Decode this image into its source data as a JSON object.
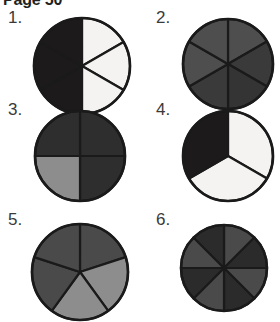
{
  "header": {
    "text": "Page 50"
  },
  "palette": {
    "ink": "#1a1a1a",
    "paper": "#ffffff",
    "black_fill": "#1c1a1a",
    "very_dark_gray": "#2b2b2b",
    "dark_gray": "#3a3a3a",
    "medium_gray": "#4a4a4a",
    "mid_gray": "#565656",
    "light_gray": "#8d8d8d",
    "lighter_gray": "#9a9a9a",
    "white_fill": "#f4f3f1",
    "label_color": "#3a3a3a"
  },
  "chart_data": [
    {
      "type": "pie",
      "id": "pie-1",
      "label": "1.",
      "slice_count": 6,
      "equal_slices": true,
      "slice_fraction": "1/6",
      "shaded_count": 3,
      "unshaded_count": 3,
      "fraction_shaded": "3/6",
      "start_angle_deg": -90,
      "radius": 48,
      "slices": [
        {
          "index": 0,
          "value": 1,
          "state": "unshaded",
          "fill": "#f4f3f1"
        },
        {
          "index": 1,
          "value": 1,
          "state": "unshaded",
          "fill": "#f4f3f1"
        },
        {
          "index": 2,
          "value": 1,
          "state": "unshaded",
          "fill": "#f4f3f1"
        },
        {
          "index": 3,
          "value": 1,
          "state": "shaded",
          "fill": "#1c1a1a"
        },
        {
          "index": 4,
          "value": 1,
          "state": "shaded",
          "fill": "#1c1a1a"
        },
        {
          "index": 5,
          "value": 1,
          "state": "shaded",
          "fill": "#1c1a1a"
        }
      ]
    },
    {
      "type": "pie",
      "id": "pie-2",
      "label": "2.",
      "slice_count": 6,
      "equal_slices": true,
      "slice_fraction": "1/6",
      "shaded_count": 6,
      "unshaded_count": 0,
      "fraction_shaded": "6/6",
      "start_angle_deg": -90,
      "radius": 45,
      "slices": [
        {
          "index": 0,
          "value": 1,
          "state": "shaded",
          "fill": "#4e4e4e"
        },
        {
          "index": 1,
          "value": 1,
          "state": "shaded",
          "fill": "#3a3a3a"
        },
        {
          "index": 2,
          "value": 1,
          "state": "shaded",
          "fill": "#343434"
        },
        {
          "index": 3,
          "value": 1,
          "state": "shaded",
          "fill": "#3a3a3a"
        },
        {
          "index": 4,
          "value": 1,
          "state": "shaded",
          "fill": "#4e4e4e"
        },
        {
          "index": 5,
          "value": 1,
          "state": "shaded",
          "fill": "#4e4e4e"
        }
      ]
    },
    {
      "type": "pie",
      "id": "pie-3",
      "label": "3.",
      "slice_count": 4,
      "equal_slices": true,
      "slice_fraction": "1/4",
      "shaded_count": 3,
      "unshaded_count": 1,
      "fraction_shaded": "3/4",
      "start_angle_deg": -90,
      "radius": 45,
      "slices": [
        {
          "index": 0,
          "value": 1,
          "state": "shaded",
          "fill": "#2e2e2e"
        },
        {
          "index": 1,
          "value": 1,
          "state": "shaded",
          "fill": "#2e2e2e"
        },
        {
          "index": 2,
          "value": 1,
          "state": "light",
          "fill": "#8d8d8d"
        },
        {
          "index": 3,
          "value": 1,
          "state": "shaded",
          "fill": "#2e2e2e"
        }
      ]
    },
    {
      "type": "pie",
      "id": "pie-4",
      "label": "4.",
      "slice_count": 3,
      "equal_slices": true,
      "slice_fraction": "1/3",
      "shaded_count": 1,
      "unshaded_count": 2,
      "fraction_shaded": "1/3",
      "start_angle_deg": -90,
      "radius": 45,
      "slices": [
        {
          "index": 0,
          "value": 1,
          "state": "unshaded",
          "fill": "#f4f3f1"
        },
        {
          "index": 1,
          "value": 1,
          "state": "unshaded",
          "fill": "#f4f3f1"
        },
        {
          "index": 2,
          "value": 1,
          "state": "shaded",
          "fill": "#1c1a1a"
        }
      ]
    },
    {
      "type": "pie",
      "id": "pie-5",
      "label": "5.",
      "slice_count": 5,
      "equal_slices": true,
      "slice_fraction": "1/5",
      "shaded_count": 3,
      "unshaded_count": 2,
      "fraction_shaded": "3/5",
      "start_angle_deg": -90,
      "radius": 48,
      "clipped_at_page_bottom": true,
      "slices": [
        {
          "index": 0,
          "value": 1,
          "state": "shaded",
          "fill": "#4a4a4a"
        },
        {
          "index": 1,
          "value": 1,
          "state": "light",
          "fill": "#8d8d8d"
        },
        {
          "index": 2,
          "value": 1,
          "state": "light",
          "fill": "#8d8d8d"
        },
        {
          "index": 3,
          "value": 1,
          "state": "shaded",
          "fill": "#4a4a4a"
        },
        {
          "index": 4,
          "value": 1,
          "state": "shaded",
          "fill": "#4a4a4a"
        }
      ]
    },
    {
      "type": "pie",
      "id": "pie-6",
      "label": "6.",
      "slice_count": 8,
      "equal_slices": true,
      "slice_fraction": "1/8",
      "shaded_count": 8,
      "unshaded_count": 0,
      "fraction_shaded": "8/8",
      "start_angle_deg": -90,
      "radius": 43,
      "clipped_at_page_bottom": true,
      "slices": [
        {
          "index": 0,
          "value": 1,
          "state": "shaded",
          "fill": "#4a4a4a"
        },
        {
          "index": 1,
          "value": 1,
          "state": "shaded",
          "fill": "#2b2b2b"
        },
        {
          "index": 2,
          "value": 1,
          "state": "shaded",
          "fill": "#4a4a4a"
        },
        {
          "index": 3,
          "value": 1,
          "state": "shaded",
          "fill": "#2b2b2b"
        },
        {
          "index": 4,
          "value": 1,
          "state": "shaded",
          "fill": "#4a4a4a"
        },
        {
          "index": 5,
          "value": 1,
          "state": "shaded",
          "fill": "#2b2b2b"
        },
        {
          "index": 6,
          "value": 1,
          "state": "shaded",
          "fill": "#4a4a4a"
        },
        {
          "index": 7,
          "value": 1,
          "state": "shaded",
          "fill": "#2b2b2b"
        }
      ]
    }
  ]
}
